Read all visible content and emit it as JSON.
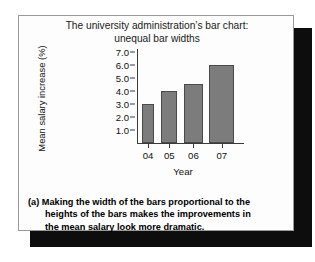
{
  "figure": {
    "title_lines": [
      "The university administration’s bar chart:",
      "unequal bar widths"
    ],
    "caption_lines": [
      "(a) Making the width of the bars proportional to the",
      "heights of the bars makes the improvements in",
      "the mean salary look more dramatic."
    ],
    "frame_color": "#9a9a9a",
    "shadow_color": "#0d0d0d",
    "panel_background": "#fdfdfd"
  },
  "chart_data": {
    "type": "bar",
    "title": "The university administration’s bar chart: unequal bar widths",
    "categories": [
      "04",
      "05",
      "06",
      "07"
    ],
    "values": [
      3.0,
      4.0,
      4.5,
      6.0
    ],
    "bar_widths_relative": [
      0.62,
      0.78,
      0.9,
      1.2
    ],
    "xlabel": "Year",
    "ylabel": "Mean salary increase (%)",
    "ylim": [
      0,
      7.2
    ],
    "yticks": [
      1.0,
      2.0,
      3.0,
      4.0,
      5.0,
      6.0,
      7.0
    ],
    "ytick_labels": [
      "1.0",
      "2.0",
      "3.0",
      "4.0",
      "5.0",
      "6.0",
      "7.0"
    ],
    "grid": false,
    "legend": null,
    "bar_fill_color": "#7c7c7c",
    "bar_edge_color": "#4a4a4a",
    "axis_color": "#3a3a3a"
  }
}
